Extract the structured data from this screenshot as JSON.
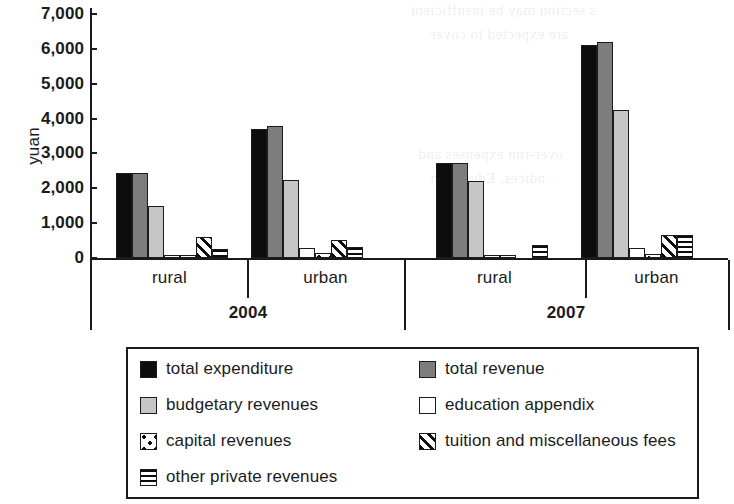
{
  "chart_data": {
    "type": "bar",
    "title": "",
    "xlabel": "",
    "ylabel": "yuan",
    "ylim": [
      0,
      7000
    ],
    "yticks": [
      "0",
      "1,000",
      "2,000",
      "3,000",
      "4,000",
      "5,000",
      "6,000",
      "7,000"
    ],
    "ytick_values": [
      0,
      1000,
      2000,
      3000,
      4000,
      5000,
      6000,
      7000
    ],
    "grid": false,
    "legend_position": "bottom",
    "group_labels": [
      "2004",
      "2007"
    ],
    "categories": [
      "rural",
      "urban",
      "rural",
      "urban"
    ],
    "category_groups": [
      {
        "group": "2004",
        "subcategories": [
          "rural",
          "urban"
        ]
      },
      {
        "group": "2007",
        "subcategories": [
          "rural",
          "urban"
        ]
      }
    ],
    "series": [
      {
        "name": "total expenditure",
        "fill": "solid-black",
        "values": [
          2450,
          3700,
          2720,
          6100
        ]
      },
      {
        "name": "total revenue",
        "fill": "solid-dark-gray",
        "values": [
          2450,
          3800,
          2720,
          6200
        ]
      },
      {
        "name": "budgetary revenues",
        "fill": "solid-light-gray",
        "values": [
          1500,
          2250,
          2220,
          4250
        ]
      },
      {
        "name": "education appendix",
        "fill": "white",
        "values": [
          100,
          280,
          90,
          280
        ]
      },
      {
        "name": "capital revenues",
        "fill": "dotted",
        "values": [
          50,
          130,
          20,
          120
        ]
      },
      {
        "name": "tuition and miscellaneous fees",
        "fill": "diagonal-stripes",
        "values": [
          600,
          530,
          0,
          650
        ]
      },
      {
        "name": "other private revenues",
        "fill": "horizontal-lines",
        "values": [
          250,
          330,
          370,
          650
        ]
      }
    ],
    "colors": {
      "total_expenditure": "#0d0d0d",
      "total_revenue": "#7d7d7d",
      "budgetary_revenues": "#c6c6c6",
      "education_appendix": "#ffffff",
      "axis": "#1b1b1b",
      "background": "#ffffff"
    }
  },
  "axis": {
    "y_title": "yuan"
  },
  "legend": {
    "items": [
      {
        "label": "total expenditure",
        "fill": "solid-black"
      },
      {
        "label": "total revenue",
        "fill": "solid-dark-gray"
      },
      {
        "label": "budgetary revenues",
        "fill": "solid-light-gray"
      },
      {
        "label": "education appendix",
        "fill": "white"
      },
      {
        "label": "capital revenues",
        "fill": "dotted"
      },
      {
        "label": "tuition and miscellaneous fees",
        "fill": "diagonal-stripes"
      },
      {
        "label": "other private revenues",
        "fill": "horizontal-lines"
      }
    ]
  },
  "ghost_text": {
    "lines": [
      "s section may be insufficient",
      "are expected to cover",
      "over-run expenses and",
      "ndices. Education",
      "of the"
    ]
  }
}
